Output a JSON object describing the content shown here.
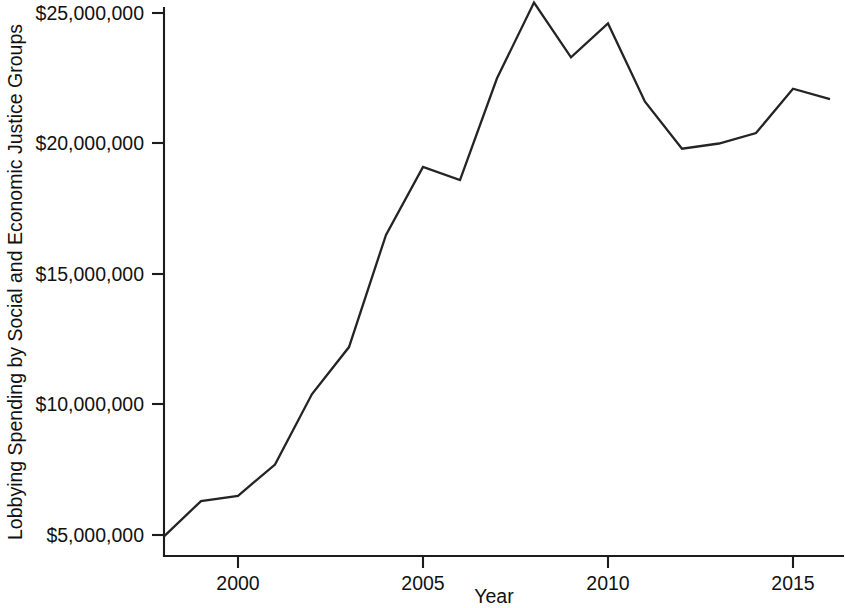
{
  "chart_data": {
    "type": "line",
    "title": "",
    "subtitle": "",
    "xlabel": "Year",
    "ylabel": "Lobbying Spending by Social and Economic Justice Groups",
    "x": [
      1998,
      1999,
      2000,
      2001,
      2002,
      2003,
      2004,
      2005,
      2006,
      2007,
      2008,
      2009,
      2010,
      2011,
      2012,
      2013,
      2014,
      2015,
      2016
    ],
    "values": [
      4950000,
      6300000,
      6500000,
      7700000,
      10400000,
      12200000,
      16500000,
      19100000,
      18600000,
      22500000,
      25400000,
      23300000,
      24600000,
      21600000,
      19800000,
      20000000,
      20400000,
      22100000,
      21700000
    ],
    "series": [
      {
        "name": "Lobbying Spending by Social and Economic Justice Groups",
        "values": [
          4950000,
          6300000,
          6500000,
          7700000,
          10400000,
          12200000,
          16500000,
          19100000,
          18600000,
          22500000,
          25400000,
          23300000,
          24600000,
          21600000,
          19800000,
          20000000,
          20400000,
          22100000,
          21700000
        ]
      }
    ],
    "xlim": [
      1998,
      2016.2
    ],
    "ylim": [
      4600000,
      25900000
    ],
    "xticks": [
      2000,
      2005,
      2010,
      2015
    ],
    "xtick_labels": [
      "2000",
      "2005",
      "2010",
      "2015"
    ],
    "yticks": [
      5000000,
      10000000,
      15000000,
      20000000,
      25000000
    ],
    "ytick_labels": [
      "$5,000,000",
      "$10,000,000",
      "$15,000,000",
      "$20,000,000",
      "$25,000,000"
    ],
    "grid": false,
    "legend": false,
    "legend_position": "none",
    "line_color": "#242424",
    "axis_color": "#1c1c1c",
    "background_color": "#ffffff"
  }
}
